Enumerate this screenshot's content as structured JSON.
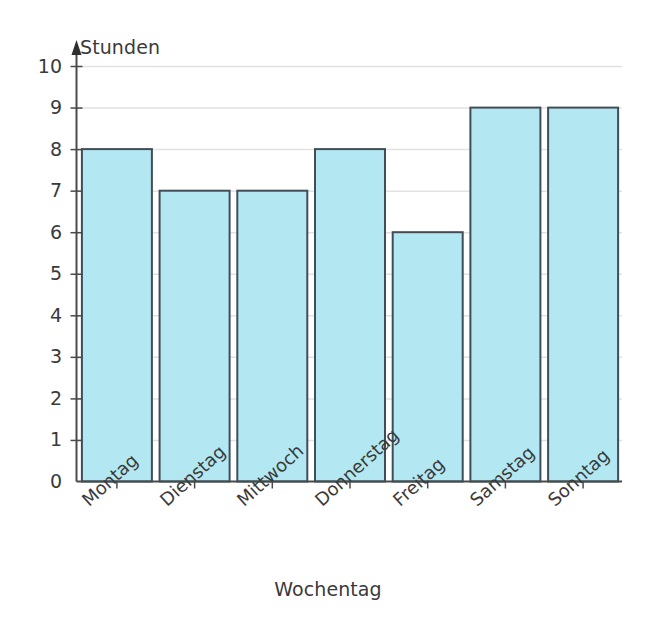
{
  "chart_data": {
    "type": "bar",
    "title": "",
    "xlabel": "Wochentag",
    "ylabel": "Stunden",
    "categories": [
      "Montag",
      "Dienstag",
      "Mittwoch",
      "Donnerstag",
      "Freitag",
      "Samstag",
      "Sonntag"
    ],
    "values": [
      8,
      7,
      7,
      8,
      6,
      9,
      9
    ],
    "ylim": [
      0,
      10
    ],
    "ytick_labels": [
      "0",
      "1",
      "2",
      "3",
      "4",
      "5",
      "6",
      "7",
      "8",
      "9",
      "10"
    ],
    "grid": true,
    "legend": "none",
    "bar_fill_color": "#b3e8f2",
    "bar_border_color": "#3f4e58",
    "grid_color": "#e2e2e2",
    "axis_color": "#4a4a4a"
  }
}
